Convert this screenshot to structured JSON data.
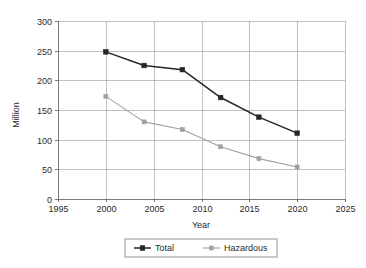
{
  "chart_data": {
    "type": "line",
    "title": "",
    "xlabel": "Year",
    "ylabel": "Million",
    "xlim": [
      1995,
      2025
    ],
    "ylim": [
      0,
      300
    ],
    "x_ticks": [
      "1995",
      "2000",
      "2005",
      "2010",
      "2015",
      "2020",
      "2025"
    ],
    "y_ticks": [
      "0",
      "50",
      "100",
      "150",
      "200",
      "250",
      "300"
    ],
    "grid": true,
    "legend_position": "bottom-center",
    "x": [
      2000,
      2004,
      2008,
      2012,
      2016,
      2020
    ],
    "series": [
      {
        "name": "Total",
        "color": "#262626",
        "marker": "square",
        "values": [
          248,
          225,
          218,
          171,
          138,
          111
        ]
      },
      {
        "name": "Hazardous",
        "color": "#a0a0a0",
        "marker": "square",
        "values": [
          173,
          130,
          117,
          88,
          68,
          54
        ]
      }
    ]
  },
  "axes": {
    "y_label": "Million",
    "x_label": "Year",
    "x_tick_labels": [
      "1995",
      "2000",
      "2005",
      "2010",
      "2015",
      "2020",
      "2025"
    ],
    "y_tick_labels": [
      "0",
      "50",
      "100",
      "150",
      "200",
      "250",
      "300"
    ]
  },
  "legend": {
    "entries": [
      {
        "label": "Total",
        "color": "#262626"
      },
      {
        "label": "Hazardous",
        "color": "#a0a0a0"
      }
    ]
  }
}
